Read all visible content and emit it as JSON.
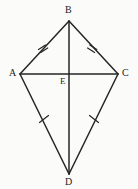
{
  "figure": {
    "type": "geometry-diagram",
    "shape": "kite",
    "background_color": "#fbfbf9",
    "line_color": "#262626",
    "label_color": "#1c1c1c",
    "canvas": {
      "width": 138,
      "height": 189
    },
    "vertices": [
      {
        "id": "B",
        "label": "B",
        "x": 69,
        "y": 21
      },
      {
        "id": "A",
        "label": "A",
        "x": 20,
        "y": 74
      },
      {
        "id": "C",
        "label": "C",
        "x": 118,
        "y": 74
      },
      {
        "id": "D",
        "label": "D",
        "x": 69,
        "y": 174
      },
      {
        "id": "E",
        "label": "E",
        "x": 69,
        "y": 74
      }
    ],
    "segments": [
      {
        "id": "AB",
        "from": "A",
        "to": "B",
        "ticks": 2
      },
      {
        "id": "BC",
        "from": "B",
        "to": "C",
        "ticks": 2
      },
      {
        "id": "AD",
        "from": "A",
        "to": "D",
        "ticks": 1
      },
      {
        "id": "DC",
        "from": "D",
        "to": "C",
        "ticks": 1
      },
      {
        "id": "AC",
        "from": "A",
        "to": "C",
        "ticks": 0
      },
      {
        "id": "BD",
        "from": "B",
        "to": "D",
        "ticks": 0
      }
    ],
    "tick_marks": [
      {
        "on": "AB",
        "count": 2,
        "x": 43,
        "y": 50
      },
      {
        "on": "BC",
        "count": 2,
        "x": 94,
        "y": 50
      },
      {
        "on": "AD",
        "count": 1,
        "x": 44,
        "y": 119
      },
      {
        "on": "DC",
        "count": 1,
        "x": 94,
        "y": 119
      }
    ]
  }
}
